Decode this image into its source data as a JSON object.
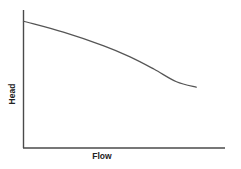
{
  "chart_data": {
    "type": "line",
    "title": "",
    "xlabel": "Flow",
    "ylabel": "Head",
    "grid": false,
    "legend": null,
    "ticks": false,
    "series": [
      {
        "name": "Pump curve",
        "x": [
          0,
          0.2,
          0.4,
          0.53,
          0.65,
          0.76,
          0.86
        ],
        "y": [
          0.92,
          0.84,
          0.74,
          0.66,
          0.57,
          0.48,
          0.44
        ]
      }
    ],
    "axis_ranges": {
      "x": [
        0,
        1
      ],
      "y": [
        0,
        1
      ]
    }
  },
  "labels": {
    "x_axis": "Flow",
    "y_axis": "Head"
  },
  "colors": {
    "axis": "#4a4a4a",
    "curve": "#555555",
    "text": "#222222",
    "background": "#ffffff"
  }
}
